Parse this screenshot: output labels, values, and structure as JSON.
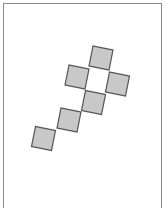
{
  "diagram": {
    "type": "cube-net",
    "rotation_deg": 11.3,
    "square_size": 20.4,
    "colors": {
      "square_fill": "#c8c8c8",
      "square_stroke": "#555555",
      "frame_stroke": "#8a8a8a",
      "background": "#ffffff"
    },
    "squares": [
      {
        "id": "top",
        "cx": 101,
        "cy": 58
      },
      {
        "id": "middle-left",
        "cx": 77,
        "cy": 77
      },
      {
        "id": "middle-right",
        "cx": 117.5,
        "cy": 84
      },
      {
        "id": "below-center",
        "cx": 93.5,
        "cy": 102.5
      },
      {
        "id": "lower",
        "cx": 69,
        "cy": 120
      },
      {
        "id": "bottom-left",
        "cx": 43.5,
        "cy": 138.5
      }
    ],
    "empty_cell": {
      "id": "center",
      "cx": 97,
      "cy": 80
    }
  }
}
